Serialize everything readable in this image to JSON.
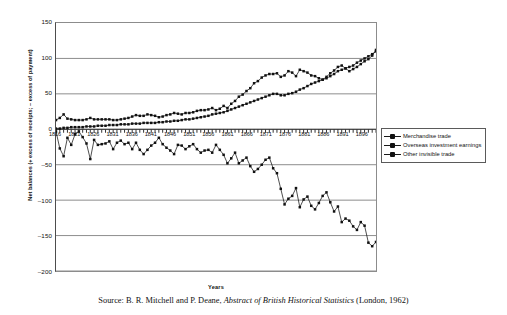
{
  "chart_data": {
    "type": "line",
    "title": "",
    "xlabel": "Years",
    "ylabel": "Net balances (+ excess of receipts; – excess of payment)",
    "ylim": [
      -200,
      150
    ],
    "yticks": [
      150,
      100,
      50,
      0,
      -50,
      -100,
      -150,
      -200
    ],
    "ytick_labels": [
      "150",
      "100",
      "50",
      "0",
      "–50",
      "–100",
      "–150",
      "–200"
    ],
    "xlim": [
      1816,
      1900
    ],
    "xticks": [
      1816,
      1821,
      1826,
      1831,
      1836,
      1841,
      1846,
      1851,
      1856,
      1861,
      1866,
      1871,
      1876,
      1881,
      1886,
      1891,
      1896
    ],
    "xtick_labels": [
      "1816",
      "1821",
      "1826",
      "1831",
      "1836",
      "1841",
      "1846",
      "1851",
      "1856",
      "1861",
      "1866",
      "1871",
      "1876",
      "1881",
      "1886",
      "1891",
      "1896"
    ],
    "grid": true,
    "grid_axis": "y",
    "legend_position": "right",
    "marker": "filled-square",
    "x": [
      1816,
      1817,
      1818,
      1819,
      1820,
      1821,
      1822,
      1823,
      1824,
      1825,
      1826,
      1827,
      1828,
      1829,
      1830,
      1831,
      1832,
      1833,
      1834,
      1835,
      1836,
      1837,
      1838,
      1839,
      1840,
      1841,
      1842,
      1843,
      1844,
      1845,
      1846,
      1847,
      1848,
      1849,
      1850,
      1851,
      1852,
      1853,
      1854,
      1855,
      1856,
      1857,
      1858,
      1859,
      1860,
      1861,
      1862,
      1863,
      1864,
      1865,
      1866,
      1867,
      1868,
      1869,
      1870,
      1871,
      1872,
      1873,
      1874,
      1875,
      1876,
      1877,
      1878,
      1879,
      1880,
      1881,
      1882,
      1883,
      1884,
      1885,
      1886,
      1887,
      1888,
      1889,
      1890,
      1891,
      1892,
      1893,
      1894,
      1895,
      1896,
      1897,
      1898,
      1899,
      1900
    ],
    "series": [
      {
        "name": "Merchandise trade",
        "values": [
          -3,
          -27,
          -38,
          -12,
          -22,
          -7,
          -3,
          -11,
          -20,
          -42,
          -15,
          -22,
          -21,
          -20,
          -17,
          -28,
          -19,
          -16,
          -21,
          -19,
          -28,
          -19,
          -29,
          -35,
          -29,
          -23,
          -19,
          -12,
          -21,
          -26,
          -30,
          -35,
          -22,
          -23,
          -28,
          -24,
          -21,
          -28,
          -33,
          -30,
          -29,
          -33,
          -22,
          -29,
          -36,
          -48,
          -41,
          -33,
          -48,
          -44,
          -40,
          -52,
          -60,
          -56,
          -50,
          -43,
          -40,
          -55,
          -62,
          -84,
          -106,
          -98,
          -94,
          -83,
          -110,
          -99,
          -95,
          -108,
          -113,
          -104,
          -94,
          -89,
          -103,
          -116,
          -109,
          -131,
          -126,
          -129,
          -137,
          -142,
          -131,
          -136,
          -160,
          -165,
          -159
        ]
      },
      {
        "name": "Overseas investment earnings",
        "values": [
          1,
          1,
          2,
          2,
          3,
          3,
          3,
          3,
          4,
          4,
          4,
          5,
          5,
          5,
          6,
          6,
          6,
          7,
          7,
          7,
          8,
          8,
          8,
          9,
          9,
          9,
          9,
          10,
          10,
          11,
          11,
          12,
          12,
          13,
          14,
          14,
          15,
          16,
          17,
          18,
          19,
          21,
          22,
          23,
          24,
          26,
          28,
          30,
          32,
          34,
          36,
          38,
          40,
          42,
          44,
          46,
          48,
          50,
          50,
          48,
          48,
          50,
          51,
          53,
          56,
          58,
          61,
          64,
          66,
          68,
          70,
          72,
          75,
          78,
          82,
          84,
          86,
          88,
          90,
          94,
          97,
          100,
          103,
          106,
          110
        ]
      },
      {
        "name": "Other invisible trade",
        "values": [
          13,
          16,
          21,
          15,
          14,
          13,
          13,
          13,
          14,
          16,
          14,
          14,
          14,
          14,
          14,
          13,
          13,
          14,
          15,
          16,
          18,
          20,
          19,
          19,
          21,
          20,
          19,
          17,
          18,
          20,
          21,
          23,
          22,
          21,
          23,
          23,
          24,
          26,
          27,
          27,
          28,
          30,
          27,
          29,
          33,
          30,
          36,
          40,
          46,
          49,
          54,
          58,
          65,
          68,
          73,
          76,
          78,
          78,
          79,
          74,
          76,
          82,
          80,
          75,
          84,
          82,
          80,
          76,
          75,
          72,
          70,
          74,
          79,
          83,
          88,
          90,
          86,
          82,
          85,
          88,
          92,
          96,
          99,
          104,
          112
        ]
      }
    ]
  },
  "legend": {
    "items": [
      {
        "label": "Merchandise trade"
      },
      {
        "label": "Overseas investment earnings"
      },
      {
        "label": "Other invisible trade"
      }
    ]
  },
  "caption": {
    "prefix": "Source: B. R. Mitchell and P. Deane, ",
    "italic": "Abstract of British Historical Statistics",
    "suffix": " (London, 1962)"
  }
}
